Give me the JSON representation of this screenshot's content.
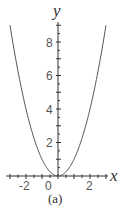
{
  "chart_data": {
    "type": "line",
    "title": "",
    "caption": "(a)",
    "xlabel": "x",
    "ylabel": "y",
    "xlim": [
      -3.3,
      3.1
    ],
    "ylim": [
      0,
      9.2
    ],
    "x_ticks": [
      -2,
      0,
      2
    ],
    "x_tick_labels": [
      "-2",
      "0",
      "2"
    ],
    "y_ticks": [
      2,
      4,
      6,
      8
    ],
    "y_tick_labels": [
      "2",
      "4",
      "6",
      "8"
    ],
    "grid": false,
    "legend": null,
    "series": [
      {
        "name": "y = x^2",
        "color": "#555555",
        "x": [
          -3.0,
          -2.5,
          -2.0,
          -1.5,
          -1.0,
          -0.5,
          0.0,
          0.5,
          1.0,
          1.5,
          2.0,
          2.5,
          3.0
        ],
        "y": [
          9.0,
          6.25,
          4.0,
          2.25,
          1.0,
          0.25,
          0.0,
          0.25,
          1.0,
          2.25,
          4.0,
          6.25,
          9.0
        ]
      }
    ]
  },
  "labels": {
    "x_axis": "x",
    "y_axis": "y",
    "caption": "(a)",
    "xt_neg2": "-2",
    "xt_0": "0",
    "xt_2": "2",
    "yt_2": "2",
    "yt_4": "4",
    "yt_6": "6",
    "yt_8": "8"
  },
  "colors": {
    "axis": "#333333",
    "curve": "#555555",
    "text": "#555555"
  }
}
